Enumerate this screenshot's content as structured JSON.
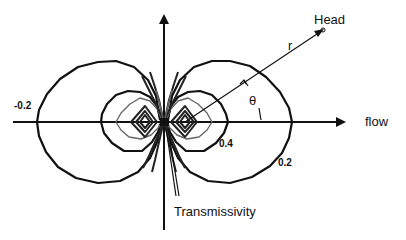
{
  "diagram": {
    "type": "dipole-contour-sketch",
    "labels": {
      "head": "Head",
      "r": "r",
      "theta": "θ",
      "flow": "flow",
      "transmissivity": "Transmissivity"
    },
    "contour_labels": {
      "left_outer": "-0.2",
      "right_inner": "0.4",
      "right_outer": "0.2"
    },
    "colors": {
      "line": "#111111",
      "secondary_contour": "#666666",
      "background": "#ffffff"
    }
  }
}
